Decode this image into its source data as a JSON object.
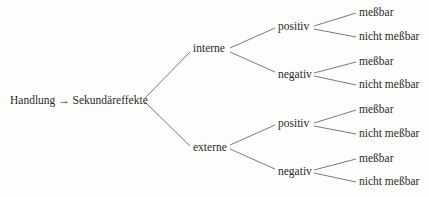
{
  "root": {
    "label": "Handlung → Sekundäreffekte"
  },
  "branches": [
    {
      "label": "interne",
      "children": [
        {
          "label": "positiv",
          "leaves": [
            "meßbar",
            "nicht meßbar"
          ]
        },
        {
          "label": "negativ",
          "leaves": [
            "meßbar",
            "nicht meßbar"
          ]
        }
      ]
    },
    {
      "label": "externe",
      "children": [
        {
          "label": "positiv",
          "leaves": [
            "meßbar",
            "nicht meßbar"
          ]
        },
        {
          "label": "negativ",
          "leaves": [
            "meßbar",
            "nicht meßbar"
          ]
        }
      ]
    }
  ],
  "colors": {
    "line": "#6a6a6a",
    "text": "#2a2a2a",
    "background": "#fdfdfc"
  }
}
